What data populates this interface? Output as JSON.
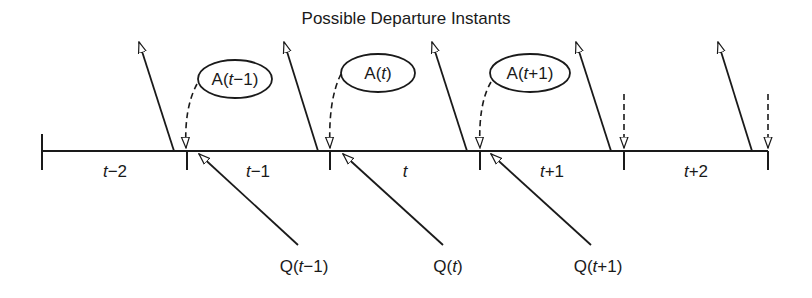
{
  "title": "Possible Departure Instants",
  "intervals": [
    {
      "label_var": "t",
      "label_op": "−",
      "label_num": "2"
    },
    {
      "label_var": "t",
      "label_op": "−",
      "label_num": "1"
    },
    {
      "label_var": "t",
      "label_op": "",
      "label_num": ""
    },
    {
      "label_var": "t",
      "label_op": "+",
      "label_num": "1"
    },
    {
      "label_var": "t",
      "label_op": "+",
      "label_num": "2"
    }
  ],
  "arrivals": [
    {
      "prefix": "A(",
      "var": "t",
      "rest": "−1)"
    },
    {
      "prefix": "A(",
      "var": "t",
      "rest": ")"
    },
    {
      "prefix": "A(",
      "var": "t",
      "rest": "+1)"
    }
  ],
  "queues": [
    {
      "prefix": "Q(",
      "var": "t",
      "rest": "−1)"
    },
    {
      "prefix": "Q(",
      "var": "t",
      "rest": ")"
    },
    {
      "prefix": "Q(",
      "var": "t",
      "rest": "+1)"
    }
  ],
  "colors": {
    "line": "#1a1a1a",
    "background": "#ffffff"
  }
}
